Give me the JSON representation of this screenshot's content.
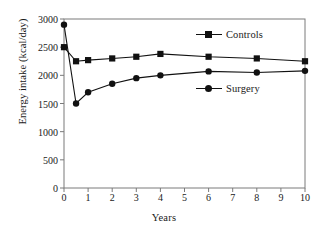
{
  "chart_data": {
    "type": "line",
    "title": "",
    "subtitle": "",
    "xlabel": "Years",
    "ylabel": "Energy intake (kcal/day)",
    "xlim": [
      0,
      10
    ],
    "ylim": [
      0,
      3000
    ],
    "grid": false,
    "legend_position": "inside-right",
    "x_ticks": [
      0,
      1,
      2,
      3,
      4,
      5,
      6,
      7,
      8,
      9,
      10
    ],
    "x_tick_labels": [
      "0",
      "1",
      "2",
      "3",
      "4",
      "5",
      "6",
      "7",
      "8",
      "9",
      "10"
    ],
    "y_ticks": [
      0,
      500,
      1000,
      1500,
      2000,
      2500,
      3000
    ],
    "y_tick_labels": [
      "0",
      "500",
      "1000",
      "1500",
      "2000",
      "2500",
      "3000"
    ],
    "x": [
      0,
      0.5,
      1,
      2,
      3,
      4,
      6,
      8,
      10
    ],
    "series": [
      {
        "name": "Controls",
        "marker": "square",
        "color": "#111111",
        "x": [
          0,
          0.5,
          1,
          2,
          3,
          4,
          6,
          8,
          10
        ],
        "values": [
          2500,
          2250,
          2270,
          2300,
          2330,
          2380,
          2330,
          2300,
          2250
        ]
      },
      {
        "name": "Surgery",
        "marker": "circle",
        "color": "#111111",
        "x": [
          0,
          0.5,
          1,
          2,
          3,
          4,
          6,
          8,
          10
        ],
        "values": [
          2900,
          1500,
          1700,
          1850,
          1950,
          2000,
          2070,
          2050,
          2080
        ]
      }
    ]
  },
  "legend": {
    "entries": [
      {
        "label": "Controls",
        "marker": "square"
      },
      {
        "label": "Surgery",
        "marker": "circle"
      }
    ]
  },
  "axes": {
    "x_title": "Years",
    "y_title": "Energy intake (kcal/day)"
  },
  "style": {
    "line_color": "#111111",
    "frame_color": "#7a7a7a",
    "text_color": "#1a1a1a",
    "background": "#ffffff"
  }
}
